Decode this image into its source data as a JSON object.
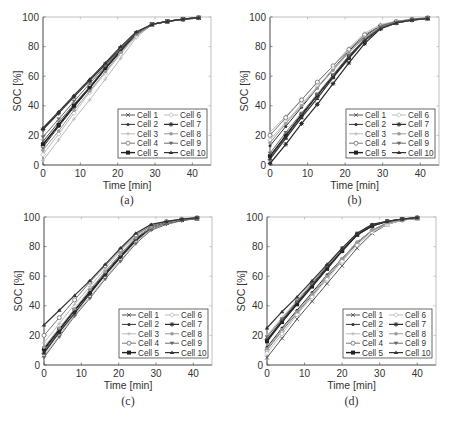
{
  "figure": {
    "panels_layout": "2x2",
    "colors": {
      "axis": "#5a5a5a",
      "text": "#333333",
      "legend_border": "#444444"
    }
  },
  "legend_entries": [
    "Cell 1",
    "Cell 2",
    "Cell 3",
    "Cell 4",
    "Cell 5",
    "Cell 6",
    "Cell 7",
    "Cell 8",
    "Cell 9",
    "Cell 10"
  ],
  "series_style": [
    {
      "name": "Cell 1",
      "color": "#555555",
      "marker": "x",
      "width": 1
    },
    {
      "name": "Cell 2",
      "color": "#333333",
      "marker": "dot",
      "width": 1
    },
    {
      "name": "Cell 3",
      "color": "#bbbbbb",
      "marker": "plus",
      "width": 1
    },
    {
      "name": "Cell 4",
      "color": "#777777",
      "marker": "circle",
      "width": 1
    },
    {
      "name": "Cell 5",
      "color": "#222222",
      "marker": "square",
      "width": 1.4
    },
    {
      "name": "Cell 6",
      "color": "#bdbdbd",
      "marker": "diamond",
      "width": 1
    },
    {
      "name": "Cell 7",
      "color": "#2a2a2a",
      "marker": "star",
      "width": 1.2
    },
    {
      "name": "Cell 8",
      "color": "#9a9a9a",
      "marker": "hexagram",
      "width": 1
    },
    {
      "name": "Cell 9",
      "color": "#6a6a6a",
      "marker": "tri-down",
      "width": 1
    },
    {
      "name": "Cell 10",
      "color": "#333333",
      "marker": "tri-up",
      "width": 1.2
    }
  ],
  "chart_data": [
    {
      "type": "line",
      "panel": "(a)",
      "caption": "(a)",
      "title": "",
      "xlabel": "Time [min]",
      "ylabel": "SOC [%]",
      "xlim": [
        0,
        45
      ],
      "ylim": [
        0,
        100
      ],
      "xticks": [
        0,
        10,
        20,
        30,
        40
      ],
      "yticks": [
        0,
        20,
        40,
        60,
        80,
        100
      ],
      "grid": false,
      "legend_position": "lower right",
      "x": [
        0,
        4.2,
        8.3,
        12.5,
        16.7,
        20.8,
        25,
        29.2,
        33.3,
        37.5,
        41.7
      ],
      "series": [
        {
          "name": "Cell 1",
          "values": [
            16,
            29,
            41,
            53,
            66,
            78,
            89,
            95,
            97,
            98.5,
            99.5
          ]
        },
        {
          "name": "Cell 2",
          "values": [
            12,
            26,
            39,
            52,
            65,
            78,
            89,
            95,
            97,
            98.5,
            99.5
          ]
        },
        {
          "name": "Cell 3",
          "values": [
            3,
            17,
            31,
            44,
            58,
            72,
            86,
            95,
            97,
            98.5,
            99.5
          ]
        },
        {
          "name": "Cell 4",
          "values": [
            13,
            27,
            40,
            53,
            66,
            79,
            89,
            95,
            97,
            98.5,
            99.5
          ]
        },
        {
          "name": "Cell 5",
          "values": [
            14,
            27,
            40,
            52,
            65,
            77,
            88,
            95,
            97,
            98.5,
            99.5
          ]
        },
        {
          "name": "Cell 6",
          "values": [
            7,
            21,
            35,
            49,
            62,
            75,
            87,
            95,
            97,
            98.5,
            99.5
          ]
        },
        {
          "name": "Cell 7",
          "values": [
            24,
            35,
            46,
            57,
            68,
            79,
            89,
            95,
            97,
            98.5,
            99.5
          ]
        },
        {
          "name": "Cell 8",
          "values": [
            10,
            23,
            37,
            50,
            63,
            76,
            88,
            95,
            97,
            98.5,
            99.5
          ]
        },
        {
          "name": "Cell 9",
          "values": [
            19,
            31,
            43,
            55,
            67,
            79,
            89,
            95,
            97,
            98.5,
            99.5
          ]
        },
        {
          "name": "Cell 10",
          "values": [
            25,
            36,
            47,
            58,
            69,
            80,
            90,
            95,
            97,
            98.5,
            99.5
          ]
        }
      ]
    },
    {
      "type": "line",
      "panel": "(b)",
      "caption": "(b)",
      "title": "",
      "xlabel": "Time [min]",
      "ylabel": "SOC [%]",
      "xlim": [
        0,
        45
      ],
      "ylim": [
        0,
        100
      ],
      "xticks": [
        0,
        10,
        20,
        30,
        40
      ],
      "yticks": [
        0,
        20,
        40,
        60,
        80,
        100
      ],
      "grid": false,
      "legend_position": "lower right",
      "x": [
        0,
        4.2,
        8.4,
        12.6,
        16.8,
        21,
        25.2,
        29.4,
        33.6,
        37.8,
        42
      ],
      "series": [
        {
          "name": "Cell 1",
          "values": [
            5,
            19,
            33,
            47,
            60,
            73,
            85,
            93,
            96,
            98,
            99
          ]
        },
        {
          "name": "Cell 2",
          "values": [
            13,
            26,
            39,
            52,
            65,
            77,
            87,
            94,
            97,
            98,
            99
          ]
        },
        {
          "name": "Cell 3",
          "values": [
            22,
            33,
            44,
            56,
            67,
            79,
            89,
            95,
            97,
            98.5,
            99.5
          ]
        },
        {
          "name": "Cell 4",
          "values": [
            20,
            32,
            44,
            56,
            67,
            78,
            88,
            94,
            97,
            98.5,
            99.5
          ]
        },
        {
          "name": "Cell 5",
          "values": [
            6,
            20,
            34,
            47,
            60,
            73,
            85,
            93,
            96,
            98,
            99
          ]
        },
        {
          "name": "Cell 6",
          "values": [
            17,
            29,
            41,
            53,
            65,
            76,
            86,
            93,
            96,
            98,
            99
          ]
        },
        {
          "name": "Cell 7",
          "values": [
            1,
            14,
            28,
            41,
            55,
            69,
            82,
            92,
            96,
            98,
            99
          ]
        },
        {
          "name": "Cell 8",
          "values": [
            15,
            28,
            40,
            52,
            64,
            76,
            86,
            93,
            96,
            98,
            99
          ]
        },
        {
          "name": "Cell 9",
          "values": [
            8,
            22,
            35,
            48,
            61,
            74,
            85,
            93,
            96,
            98,
            99
          ]
        },
        {
          "name": "Cell 10",
          "values": [
            4,
            18,
            32,
            45,
            59,
            72,
            84,
            92,
            96,
            98,
            99
          ]
        }
      ]
    },
    {
      "type": "line",
      "panel": "(c)",
      "caption": "(c)",
      "title": "",
      "xlabel": "Time [min]",
      "ylabel": "SOC [%]",
      "xlim": [
        0,
        45
      ],
      "ylim": [
        0,
        100
      ],
      "xticks": [
        0,
        10,
        20,
        30,
        40
      ],
      "yticks": [
        0,
        20,
        40,
        60,
        80,
        100
      ],
      "grid": false,
      "legend_position": "lower right",
      "x": [
        0,
        4.1,
        8.2,
        12.3,
        16.4,
        20.5,
        24.6,
        28.7,
        32.8,
        36.9,
        41
      ],
      "series": [
        {
          "name": "Cell 1",
          "values": [
            9,
            23,
            37,
            50,
            63,
            75,
            86,
            93,
            96,
            98,
            99
          ]
        },
        {
          "name": "Cell 2",
          "values": [
            10,
            24,
            37,
            49,
            62,
            74,
            85,
            93,
            96,
            98,
            99
          ]
        },
        {
          "name": "Cell 3",
          "values": [
            15,
            28,
            41,
            53,
            65,
            77,
            87,
            94,
            97,
            98.5,
            99.5
          ]
        },
        {
          "name": "Cell 4",
          "values": [
            20,
            32,
            44,
            56,
            67,
            78,
            88,
            94,
            97,
            98.5,
            99.5
          ]
        },
        {
          "name": "Cell 5",
          "values": [
            11,
            24,
            37,
            49,
            61,
            73,
            84,
            92,
            96,
            98,
            99
          ]
        },
        {
          "name": "Cell 6",
          "values": [
            6,
            20,
            34,
            46,
            59,
            71,
            83,
            92,
            96,
            98,
            99
          ]
        },
        {
          "name": "Cell 7",
          "values": [
            8,
            22,
            35,
            48,
            61,
            73,
            85,
            93,
            96,
            98,
            99
          ]
        },
        {
          "name": "Cell 8",
          "values": [
            12,
            25,
            38,
            51,
            63,
            75,
            86,
            93,
            96,
            98,
            99
          ]
        },
        {
          "name": "Cell 9",
          "values": [
            5,
            19,
            33,
            45,
            58,
            70,
            82,
            91,
            95,
            97.5,
            99
          ]
        },
        {
          "name": "Cell 10",
          "values": [
            27,
            37,
            47,
            57,
            68,
            79,
            89,
            95,
            97,
            98.5,
            99.5
          ]
        }
      ]
    },
    {
      "type": "line",
      "panel": "(d)",
      "caption": "(d)",
      "title": "",
      "xlabel": "Time [min]",
      "ylabel": "SOC [%]",
      "xlim": [
        0,
        45
      ],
      "ylim": [
        0,
        100
      ],
      "xticks": [
        0,
        10,
        20,
        30,
        40
      ],
      "yticks": [
        0,
        20,
        40,
        60,
        80,
        100
      ],
      "grid": false,
      "legend_position": "lower right",
      "x": [
        0,
        4,
        8,
        12,
        16,
        20,
        24,
        28,
        32,
        36,
        40
      ],
      "series": [
        {
          "name": "Cell 1",
          "values": [
            5,
            18,
            31,
            43,
            55,
            67,
            79,
            89,
            95,
            98,
            99
          ]
        },
        {
          "name": "Cell 2",
          "values": [
            12,
            25,
            37,
            49,
            61,
            72,
            83,
            91,
            96,
            98,
            99
          ]
        },
        {
          "name": "Cell 3",
          "values": [
            20,
            32,
            44,
            56,
            67,
            78,
            88,
            94,
            97,
            98.5,
            99.5
          ]
        },
        {
          "name": "Cell 4",
          "values": [
            10,
            23,
            35,
            47,
            59,
            71,
            82,
            91,
            95,
            98,
            99
          ]
        },
        {
          "name": "Cell 5",
          "values": [
            16,
            29,
            41,
            53,
            65,
            77,
            88,
            94,
            97,
            98.5,
            99.5
          ]
        },
        {
          "name": "Cell 6",
          "values": [
            8,
            21,
            34,
            46,
            58,
            70,
            81,
            90,
            95,
            98,
            99
          ]
        },
        {
          "name": "Cell 7",
          "values": [
            17,
            30,
            42,
            54,
            66,
            77,
            88,
            94,
            97,
            98.5,
            99.5
          ]
        },
        {
          "name": "Cell 8",
          "values": [
            11,
            24,
            36,
            48,
            60,
            72,
            83,
            91,
            96,
            98,
            99
          ]
        },
        {
          "name": "Cell 9",
          "values": [
            19,
            31,
            43,
            55,
            67,
            79,
            89,
            95,
            97,
            98.5,
            99.5
          ]
        },
        {
          "name": "Cell 10",
          "values": [
            25,
            36,
            46,
            57,
            68,
            79,
            89,
            95,
            97,
            98.5,
            99.5
          ]
        }
      ]
    }
  ],
  "panels_geometry": [
    {
      "left": 43,
      "top": 17,
      "right": 211,
      "bottom": 165,
      "caption_y": 204,
      "xlabel_y": 189
    },
    {
      "left": 270,
      "top": 17,
      "right": 439,
      "bottom": 165,
      "caption_y": 204,
      "xlabel_y": 189
    },
    {
      "left": 44,
      "top": 217,
      "right": 212,
      "bottom": 365,
      "caption_y": 405,
      "xlabel_y": 389
    },
    {
      "left": 267,
      "top": 217,
      "right": 436,
      "bottom": 365,
      "caption_y": 405,
      "xlabel_y": 389
    }
  ]
}
